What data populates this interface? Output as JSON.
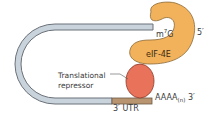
{
  "diagram": {
    "type": "mRNA closed-loop translational repression schematic",
    "labels": {
      "cap": "m",
      "cap_superscript": "7",
      "cap_suffix": "G",
      "five_prime": "5′",
      "eif": "eIF-4E",
      "repressor_line1": "Translational",
      "repressor_line2": "repressor",
      "polya": "AAAA",
      "polya_sub": "(n)",
      "three_prime": " 3′",
      "utr": "3′ UTR"
    },
    "colors": {
      "mrna_fill": "#c9d3dc",
      "mrna_stroke": "#6b7178",
      "utr_fill": "#b89470",
      "eif_fill": "#f2b25c",
      "eif_stroke": "#8a6a3a",
      "repressor_fill": "#e8735a",
      "repressor_stroke": "#8a3a2a"
    }
  }
}
